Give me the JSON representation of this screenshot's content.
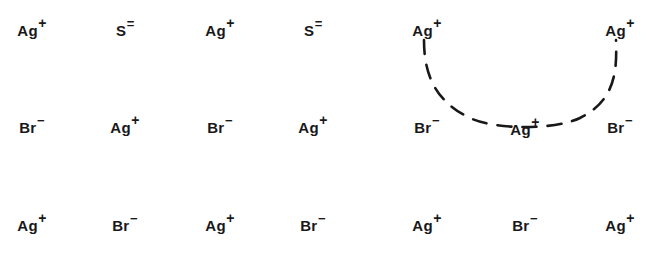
{
  "figure": {
    "width": 660,
    "height": 264,
    "background_color": "#ffffff",
    "ink_color": "#18181a"
  },
  "lattice": {
    "columns": 7,
    "rows": 3,
    "column_x": [
      32,
      125,
      220,
      313,
      427,
      525,
      620
    ],
    "row_y": [
      30,
      127,
      225
    ],
    "ions": [
      {
        "id": "r1c1",
        "symbol": "Ag",
        "charge": "+",
        "species": "silver",
        "row": 0,
        "col": 0,
        "x": 32,
        "y": 30
      },
      {
        "id": "r1c2",
        "symbol": "S",
        "charge": "=",
        "species": "sulfide",
        "row": 0,
        "col": 1,
        "x": 125,
        "y": 30
      },
      {
        "id": "r1c3",
        "symbol": "Ag",
        "charge": "+",
        "species": "silver",
        "row": 0,
        "col": 2,
        "x": 220,
        "y": 30
      },
      {
        "id": "r1c4",
        "symbol": "S",
        "charge": "=",
        "species": "sulfide",
        "row": 0,
        "col": 3,
        "x": 313,
        "y": 30
      },
      {
        "id": "r1c5",
        "symbol": "Ag",
        "charge": "+",
        "species": "silver",
        "row": 0,
        "col": 4,
        "x": 427,
        "y": 30
      },
      {
        "id": "r1c7",
        "symbol": "Ag",
        "charge": "+",
        "species": "silver",
        "row": 0,
        "col": 6,
        "x": 620,
        "y": 30
      },
      {
        "id": "r2c1",
        "symbol": "Br",
        "charge": "−",
        "species": "bromide",
        "row": 1,
        "col": 0,
        "x": 32,
        "y": 127
      },
      {
        "id": "r2c2",
        "symbol": "Ag",
        "charge": "+",
        "species": "silver",
        "row": 1,
        "col": 1,
        "x": 125,
        "y": 127
      },
      {
        "id": "r2c3",
        "symbol": "Br",
        "charge": "−",
        "species": "bromide",
        "row": 1,
        "col": 2,
        "x": 220,
        "y": 127
      },
      {
        "id": "r2c4",
        "symbol": "Ag",
        "charge": "+",
        "species": "silver",
        "row": 1,
        "col": 3,
        "x": 313,
        "y": 127
      },
      {
        "id": "r2c5",
        "symbol": "Br",
        "charge": "−",
        "species": "bromide",
        "row": 1,
        "col": 4,
        "x": 427,
        "y": 127
      },
      {
        "id": "r2c6",
        "symbol": "Ag",
        "charge": "+",
        "species": "silver",
        "row": 1,
        "col": 5,
        "x": 525,
        "y": 129
      },
      {
        "id": "r2c7",
        "symbol": "Br",
        "charge": "−",
        "species": "bromide",
        "row": 1,
        "col": 6,
        "x": 620,
        "y": 127
      },
      {
        "id": "r3c1",
        "symbol": "Ag",
        "charge": "+",
        "species": "silver",
        "row": 2,
        "col": 0,
        "x": 32,
        "y": 225
      },
      {
        "id": "r3c2",
        "symbol": "Br",
        "charge": "−",
        "species": "bromide",
        "row": 2,
        "col": 1,
        "x": 125,
        "y": 225
      },
      {
        "id": "r3c3",
        "symbol": "Ag",
        "charge": "+",
        "species": "silver",
        "row": 2,
        "col": 2,
        "x": 220,
        "y": 225
      },
      {
        "id": "r3c4",
        "symbol": "Br",
        "charge": "−",
        "species": "bromide",
        "row": 2,
        "col": 3,
        "x": 313,
        "y": 225
      },
      {
        "id": "r3c5",
        "symbol": "Ag",
        "charge": "+",
        "species": "silver",
        "row": 2,
        "col": 4,
        "x": 427,
        "y": 225
      },
      {
        "id": "r3c6",
        "symbol": "Br",
        "charge": "−",
        "species": "bromide",
        "row": 2,
        "col": 5,
        "x": 525,
        "y": 225
      },
      {
        "id": "r3c7",
        "symbol": "Ag",
        "charge": "+",
        "species": "silver",
        "row": 2,
        "col": 6,
        "x": 620,
        "y": 225
      }
    ],
    "empty_sites": [
      {
        "row": 0,
        "col": 5,
        "x": 525,
        "y": 30,
        "note": "vacancy"
      }
    ]
  },
  "annotation": {
    "arc": {
      "style": "dashed",
      "stroke_color": "#18181a",
      "stroke_width": 2.6,
      "dash_pattern": "14 11",
      "path": "M 424 40 C 424 70, 432 100, 470 118 C 495 130, 555 130, 580 118 C 616 100, 617 70, 616 40",
      "connects": [
        "r1c5",
        "r2c6",
        "r1c7"
      ]
    }
  }
}
